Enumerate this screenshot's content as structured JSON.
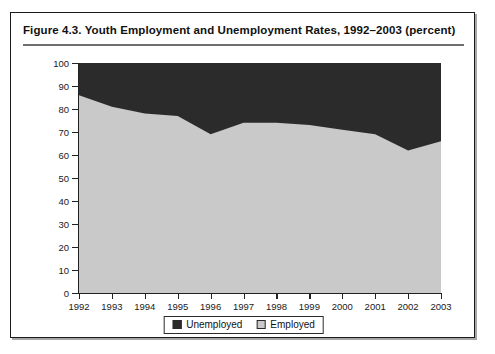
{
  "figure": {
    "title": "Figure 4.3.  Youth Employment and Unemployment Rates, 1992–2003 (percent)"
  },
  "legend": {
    "position": "bottom-center",
    "items": [
      {
        "label": "Unemployed",
        "color": "#2b2b2b",
        "name": "legend-unemployed"
      },
      {
        "label": "Employed",
        "color": "#c9c9c9",
        "name": "legend-employed"
      }
    ]
  },
  "chart_data": {
    "type": "area",
    "stacked": true,
    "title": "Figure 4.3.  Youth Employment and Unemployment Rates, 1992–2003 (percent)",
    "xlabel": "",
    "ylabel": "",
    "ylim": [
      0,
      100
    ],
    "xlim": [
      "1992",
      "2003"
    ],
    "ytick_labels": [
      "0",
      "10",
      "20",
      "30",
      "40",
      "50",
      "60",
      "70",
      "80",
      "90",
      "100"
    ],
    "yticks": [
      0,
      10,
      20,
      30,
      40,
      50,
      60,
      70,
      80,
      90,
      100
    ],
    "grid": false,
    "categories": [
      "1992",
      "1993",
      "1994",
      "1995",
      "1996",
      "1997",
      "1998",
      "1999",
      "2000",
      "2001",
      "2002",
      "2003"
    ],
    "series": [
      {
        "name": "Employed",
        "color": "#c9c9c9",
        "values": [
          86,
          81,
          78,
          77,
          69,
          74,
          74,
          73,
          71,
          69,
          62,
          66
        ]
      },
      {
        "name": "Unemployed",
        "color": "#2b2b2b",
        "values": [
          14,
          19,
          22,
          23,
          31,
          26,
          26,
          27,
          29,
          31,
          38,
          34
        ]
      }
    ]
  }
}
